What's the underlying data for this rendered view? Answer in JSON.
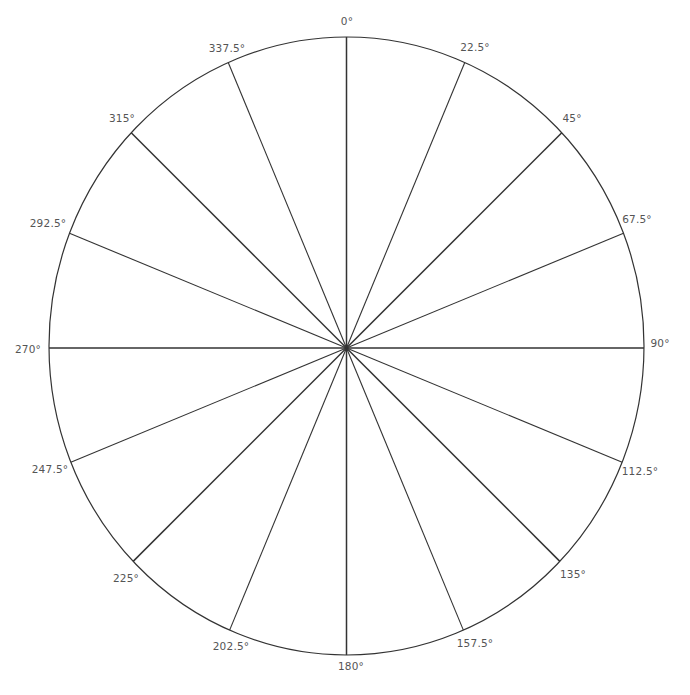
{
  "diagram": {
    "type": "polar-angle-wheel",
    "segments": 16,
    "step_degrees": 22.5,
    "line_color": "#333333",
    "label_color": "#555555",
    "labels": [
      {
        "text": "0°",
        "x": 347,
        "y": 21
      },
      {
        "text": "22.5°",
        "x": 475,
        "y": 47
      },
      {
        "text": "45°",
        "x": 572,
        "y": 118
      },
      {
        "text": "67.5°",
        "x": 637,
        "y": 219
      },
      {
        "text": "90°",
        "x": 660,
        "y": 343
      },
      {
        "text": "112.5°",
        "x": 640,
        "y": 471
      },
      {
        "text": "135°",
        "x": 573,
        "y": 574
      },
      {
        "text": "157.5°",
        "x": 475,
        "y": 643
      },
      {
        "text": "180°",
        "x": 351,
        "y": 666
      },
      {
        "text": "202.5°",
        "x": 231,
        "y": 646
      },
      {
        "text": "225°",
        "x": 126,
        "y": 578
      },
      {
        "text": "247.5°",
        "x": 50,
        "y": 469
      },
      {
        "text": "270°",
        "x": 28,
        "y": 349
      },
      {
        "text": "292.5°",
        "x": 48,
        "y": 223
      },
      {
        "text": "315°",
        "x": 122,
        "y": 118
      },
      {
        "text": "337.5°",
        "x": 227,
        "y": 48
      }
    ]
  }
}
